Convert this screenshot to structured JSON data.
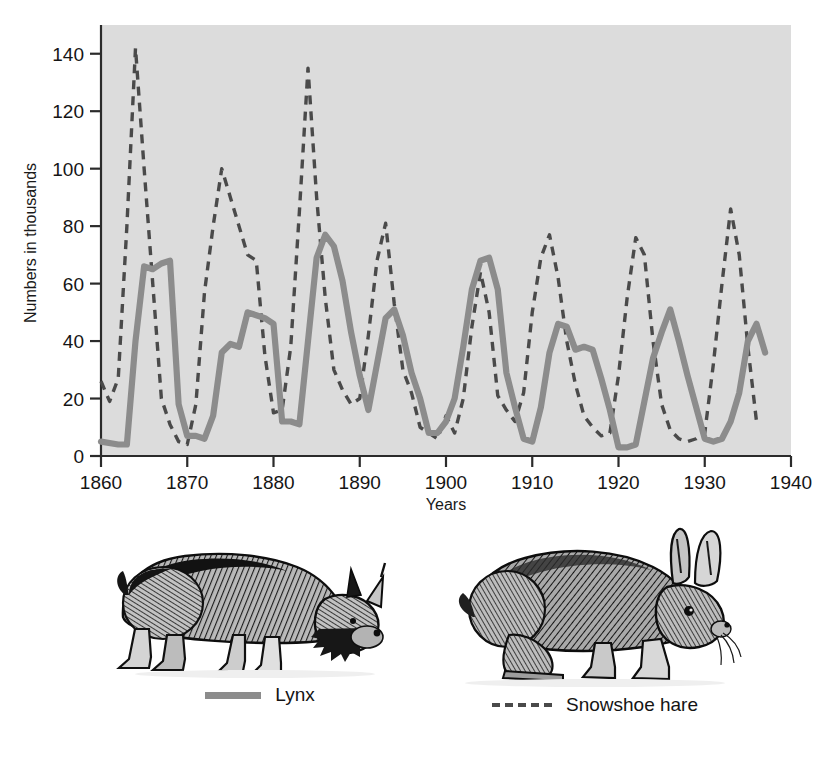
{
  "figure": {
    "background_color": "#ffffff",
    "plot_background_color": "#dcdcdc"
  },
  "axes": {
    "y_title": "Numbers in thousands",
    "x_title": "Years",
    "y_ticks": [
      "0",
      "20",
      "40",
      "60",
      "80",
      "100",
      "120",
      "140"
    ],
    "x_ticks": [
      "1860",
      "1870",
      "1880",
      "1890",
      "1900",
      "1910",
      "1920",
      "1930",
      "1940"
    ]
  },
  "legend": {
    "lynx": {
      "label": "Lynx",
      "style": "solid",
      "color": "#8c8c8c"
    },
    "hare": {
      "label": "Snowshoe hare",
      "style": "dashed",
      "color": "#4a4a4a"
    }
  },
  "illustrations": {
    "lynx": "lynx-illustration",
    "hare": "snowshoe-hare-illustration"
  },
  "chart_data": {
    "type": "line",
    "title": "",
    "xlabel": "Years",
    "ylabel": "Numbers in thousands",
    "xlim": [
      1860,
      1940
    ],
    "ylim": [
      0,
      150
    ],
    "y_ticks": [
      0,
      20,
      40,
      60,
      80,
      100,
      120,
      140
    ],
    "x_ticks": [
      1860,
      1870,
      1880,
      1890,
      1900,
      1910,
      1920,
      1930,
      1940
    ],
    "grid": false,
    "legend_position": "below-figure",
    "units": "thousands of pelts",
    "series": [
      {
        "name": "Lynx",
        "style": "solid",
        "color": "#8c8c8c",
        "x": [
          1860,
          1862,
          1863,
          1864,
          1865,
          1866,
          1867,
          1868,
          1869,
          1870,
          1871,
          1872,
          1873,
          1874,
          1875,
          1876,
          1877,
          1878,
          1879,
          1880,
          1881,
          1882,
          1883,
          1884,
          1885,
          1886,
          1887,
          1888,
          1889,
          1890,
          1891,
          1892,
          1893,
          1894,
          1895,
          1896,
          1897,
          1898,
          1899,
          1900,
          1901,
          1902,
          1903,
          1904,
          1905,
          1906,
          1907,
          1908,
          1909,
          1910,
          1911,
          1912,
          1913,
          1914,
          1915,
          1916,
          1917,
          1918,
          1919,
          1920,
          1921,
          1922,
          1923,
          1924,
          1925,
          1926,
          1927,
          1928,
          1929,
          1930,
          1931,
          1932,
          1933,
          1934,
          1935,
          1936,
          1937
        ],
        "y": [
          5,
          4,
          4,
          40,
          66,
          65,
          67,
          68,
          18,
          7,
          7,
          6,
          14,
          36,
          39,
          38,
          50,
          49,
          48,
          46,
          12,
          12,
          11,
          40,
          69,
          77,
          73,
          61,
          43,
          28,
          16,
          32,
          48,
          51,
          42,
          29,
          20,
          8,
          8,
          12,
          20,
          38,
          58,
          68,
          69,
          58,
          29,
          17,
          6,
          5,
          17,
          36,
          46,
          45,
          37,
          38,
          37,
          27,
          16,
          3,
          3,
          4,
          19,
          34,
          43,
          51,
          40,
          28,
          17,
          6,
          5,
          6,
          12,
          22,
          40,
          46,
          36
        ]
      },
      {
        "name": "Snowshoe hare",
        "style": "dashed",
        "color": "#4a4a4a",
        "x": [
          1860,
          1861,
          1862,
          1863,
          1864,
          1865,
          1866,
          1867,
          1868,
          1869,
          1870,
          1871,
          1872,
          1873,
          1874,
          1875,
          1876,
          1877,
          1878,
          1879,
          1880,
          1881,
          1882,
          1883,
          1884,
          1885,
          1886,
          1887,
          1888,
          1889,
          1890,
          1891,
          1892,
          1893,
          1894,
          1895,
          1896,
          1897,
          1898,
          1899,
          1900,
          1901,
          1902,
          1903,
          1904,
          1905,
          1906,
          1907,
          1908,
          1909,
          1910,
          1911,
          1912,
          1913,
          1914,
          1915,
          1916,
          1917,
          1918,
          1919,
          1920,
          1921,
          1922,
          1923,
          1924,
          1925,
          1926,
          1927,
          1928,
          1929,
          1930,
          1931,
          1932,
          1933,
          1934,
          1935,
          1936
        ],
        "y": [
          26,
          19,
          27,
          80,
          142,
          100,
          60,
          20,
          11,
          5,
          4,
          18,
          57,
          80,
          100,
          90,
          80,
          70,
          68,
          35,
          15,
          16,
          38,
          85,
          135,
          90,
          55,
          30,
          23,
          18,
          20,
          42,
          68,
          81,
          53,
          30,
          22,
          10,
          8,
          6,
          14,
          8,
          20,
          45,
          64,
          50,
          21,
          16,
          12,
          22,
          50,
          69,
          77,
          62,
          40,
          25,
          14,
          10,
          7,
          8,
          28,
          55,
          76,
          70,
          40,
          18,
          9,
          6,
          5,
          6,
          8,
          32,
          60,
          86,
          70,
          38,
          12
        ]
      }
    ]
  }
}
